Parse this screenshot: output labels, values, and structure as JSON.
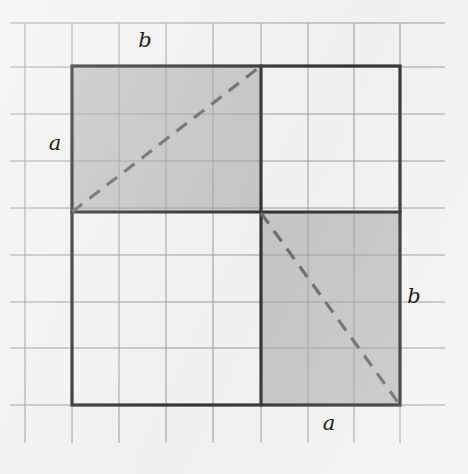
{
  "figure": {
    "colors": {
      "background": "#f4f3f1",
      "grid_line": "#9a9a9a",
      "outline": "#343434",
      "shaded_fill": "#c6c6c6",
      "shaded_edge": "#8f8f8f",
      "dashed_line": "#6d6d6d",
      "label_text": "#1d1d1d"
    },
    "labels": [
      {
        "id": "top-b",
        "text": "b",
        "x": 145,
        "y": 40
      },
      {
        "id": "left-a",
        "text": "a",
        "x": 55,
        "y": 143
      },
      {
        "id": "right-b",
        "text": "b",
        "x": 414,
        "y": 296
      },
      {
        "id": "bottom-a",
        "text": "a",
        "x": 329,
        "y": 423
      }
    ],
    "grid": {
      "vertical_x": [
        25,
        72,
        119,
        166,
        213,
        261,
        308,
        354,
        400
      ],
      "horizontal_y": [
        23,
        67,
        114,
        161,
        208,
        255,
        302,
        348,
        405
      ],
      "vertical_span": {
        "y1": 23,
        "y2": 443
      },
      "horizontal_span": {
        "x1": 10,
        "x2": 445
      },
      "line_width": 1
    },
    "outer_square": {
      "x": 72,
      "y": 66,
      "width": 328,
      "height": 339,
      "line_width": 3.2
    },
    "shaded_rectangles": [
      {
        "id": "upper-left-rect",
        "x": 72,
        "y": 66,
        "width": 189,
        "height": 146,
        "side_labels": {
          "horizontal": "b",
          "vertical": "a"
        },
        "diagonal": {
          "x1": 72,
          "y1": 212,
          "x2": 261,
          "y2": 66
        }
      },
      {
        "id": "lower-right-rect",
        "x": 261,
        "y": 213,
        "width": 139,
        "height": 192,
        "side_labels": {
          "horizontal": "a",
          "vertical": "b"
        },
        "diagonal": {
          "x1": 261,
          "y1": 213,
          "x2": 400,
          "y2": 405
        }
      }
    ],
    "inner_divider_lines": [
      {
        "id": "vertical-divider",
        "x1": 261,
        "y1": 66,
        "x2": 261,
        "y2": 405
      },
      {
        "id": "horizontal-divider",
        "x1": 72,
        "y1": 212,
        "x2": 400,
        "y2": 212
      }
    ],
    "dash_pattern": "13 9",
    "dash_width": 3.2
  },
  "chart_data": {
    "type": "diagram",
    "units": "grid cells",
    "grid_cell_size_px": 47,
    "outer_square_side_cells": 7,
    "segments": {
      "a_vertical_cells": 3,
      "b_horizontal_cells": 4,
      "a_horizontal_cells": 3,
      "b_vertical_cells": 4
    },
    "annotations": [
      "b",
      "a",
      "b",
      "a"
    ]
  }
}
